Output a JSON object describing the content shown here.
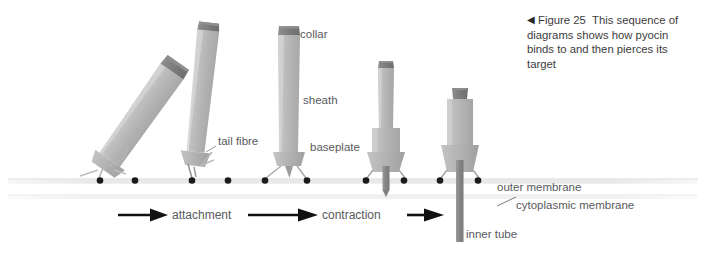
{
  "caption": {
    "marker": "◀",
    "figure_number": "Figure 25",
    "text": "This sequence of diagrams shows how pyocin binds to and then pierces its target"
  },
  "part_labels": {
    "collar": "collar",
    "sheath": "sheath",
    "baseplate": "baseplate",
    "tail_fibre": "tail fibre",
    "outer_membrane": "outer membrane",
    "cytoplasmic_membrane": "cytoplasmic membrane",
    "inner_tube": "inner tube"
  },
  "process_labels": {
    "attachment": "attachment",
    "contraction": "contraction"
  },
  "stages": [
    {
      "name": "approach-tilted",
      "state": "extended, tilted toward surface"
    },
    {
      "name": "approach-near",
      "state": "extended, slightly tilted, fibres touching"
    },
    {
      "name": "attached-extended",
      "state": "upright, extended, fibres bound to receptors"
    },
    {
      "name": "contracting",
      "state": "partially contracted, inner tube emerging"
    },
    {
      "name": "contracted-pierced",
      "state": "fully contracted, inner tube pierces both membranes"
    }
  ],
  "colors": {
    "sheath": "#b7b7b7",
    "sheath_light": "#cfcfcf",
    "collar": "#7d7d7d",
    "inner_tube": "#8a8a8a",
    "receptor_dot": "#1a1a1a",
    "membrane": "#ededed",
    "arrow": "#111111",
    "label_text": "#58595b"
  },
  "membranes": {
    "outer_y": 181,
    "cytoplasmic_y": 197
  },
  "receptor_dots_x": [
    100,
    135,
    192,
    228,
    265,
    307,
    366,
    404,
    440,
    478
  ]
}
